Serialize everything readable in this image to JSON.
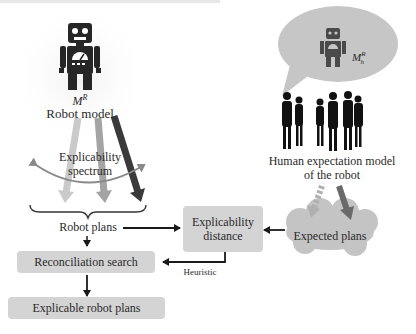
{
  "robot_model": {
    "symbol": "M",
    "symbol_superscript": "R",
    "label": "Robot model"
  },
  "spectrum": {
    "label_line1": "Explicability",
    "label_line2": "spectrum"
  },
  "robot_plans": {
    "label": "Robot plans"
  },
  "human_model": {
    "symbol": "M",
    "symbol_superscript": "R",
    "symbol_subscript": "h",
    "label_line1": "Human expectation model",
    "label_line2": "of the robot"
  },
  "explicability_distance": {
    "label_line1": "Explicability",
    "label_line2": "distance"
  },
  "expected_plans": {
    "label": "Expected plans"
  },
  "reconciliation_search": {
    "label": "Reconciliation search"
  },
  "heuristic": {
    "label": "Heuristic"
  },
  "explicable_robot_plans": {
    "label": "Explicable robot plans"
  },
  "icons": {
    "robot": "robot-icon",
    "humans": "people-silhouettes-icon",
    "thought_bubble": "thought-bubble-icon",
    "cloud": "cloud-icon"
  },
  "colors": {
    "box_fill": "#d4d4d4",
    "robot_fill": "#262626",
    "bubble_fill": "#c6c6c6",
    "arrow_light": "#c8c8c8",
    "arrow_mid": "#a0a0a0",
    "arrow_dark": "#3a3a3a"
  }
}
